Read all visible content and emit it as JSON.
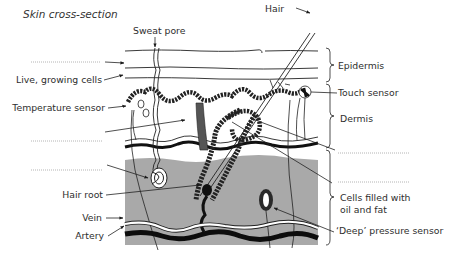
{
  "title": "Skin cross-section",
  "labels": {
    "sweat_pore": "Sweat pore",
    "hair": "Hair",
    "live_growing_cells": "Live, growing cells",
    "temperature_sensor": "Temperature sensor",
    "hair_root": "Hair root",
    "vein": "Vein",
    "artery": "Artery",
    "epidermis": "Epidermis",
    "touch_sensor": "Touch sensor",
    "dermis": "Dermis",
    "cells_filled_line1": "Cells filled with",
    "cells_filled_line2": "oil and fat",
    "deep_pressure_sensor": "‘Deep’ pressure sensor"
  },
  "blanks": {
    "left_top": "",
    "left_middle": "",
    "left_lower": "",
    "right_upper": "",
    "right_lower": ""
  },
  "colors": {
    "fat_layer": "#a9a9a9",
    "line": "#1a1a1a",
    "blood_vessel": "#111111"
  }
}
